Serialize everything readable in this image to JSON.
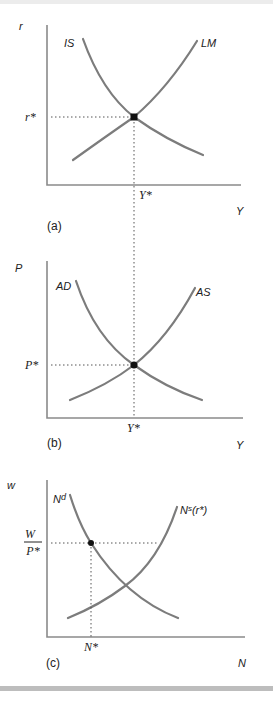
{
  "figure": {
    "colors": {
      "axis": "#8a8a8a",
      "curve": "#7c7c7c",
      "equilibrium_dot": "#111111",
      "frame_band": "#bdbdbd"
    },
    "panels": [
      {
        "id": "a",
        "panel_label": "(a)",
        "y_axis_label": "r",
        "x_axis_label": "Y",
        "curves": [
          {
            "name": "IS",
            "label": "IS",
            "slope": "downward"
          },
          {
            "name": "LM",
            "label": "LM",
            "slope": "upward"
          }
        ],
        "equilibrium": {
          "y_label": "r*",
          "x_label": "Y*"
        }
      },
      {
        "id": "b",
        "panel_label": "(b)",
        "y_axis_label": "P",
        "x_axis_label": "Y",
        "curves": [
          {
            "name": "AD",
            "label": "AD",
            "slope": "downward"
          },
          {
            "name": "AS",
            "label": "AS",
            "slope": "upward"
          }
        ],
        "equilibrium": {
          "y_label": "P*",
          "x_label": "Y*"
        }
      },
      {
        "id": "c",
        "panel_label": "(c)",
        "y_axis_label": "w",
        "x_axis_label": "N",
        "curves": [
          {
            "name": "Nd",
            "label_base": "N",
            "label_sup": "d",
            "slope": "downward"
          },
          {
            "name": "Ns",
            "label_base": "N",
            "label_sup": "s",
            "label_suffix": "(r*)",
            "slope": "upward"
          }
        ],
        "equilibrium": {
          "y_label_num": "W",
          "y_label_den": "P*",
          "x_label": "N*"
        }
      }
    ]
  }
}
